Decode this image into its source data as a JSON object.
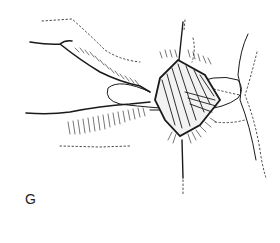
{
  "figure": {
    "panel_label": "G",
    "colors": {
      "ink": "#1a1a1a",
      "background": "#ffffff"
    }
  }
}
